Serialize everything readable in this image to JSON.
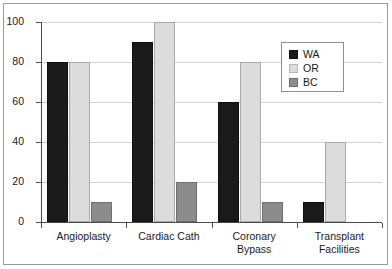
{
  "chart_data": {
    "type": "bar",
    "title": "",
    "subtitle": "",
    "xlabel": "",
    "ylabel": "",
    "categories": [
      "Angioplasty",
      "Cardiac Cath",
      "Coronary\nBypass",
      "Transplant\nFacilities"
    ],
    "series": [
      {
        "name": "WA",
        "values": [
          80,
          90,
          60,
          10
        ],
        "color": "#1a1a1a"
      },
      {
        "name": "OR",
        "values": [
          80,
          100,
          80,
          40
        ],
        "color": "#dcdcdc"
      },
      {
        "name": "BC",
        "values": [
          10,
          20,
          10,
          0
        ],
        "color": "#8c8c8c"
      }
    ],
    "ylim": [
      0,
      100
    ],
    "yticks": [
      0,
      20,
      40,
      60,
      80,
      100
    ],
    "ytick_labels": [
      "0",
      "20",
      "40",
      "60",
      "80",
      "100"
    ],
    "grid": true,
    "grid_axis": "y",
    "legend_position": "upper right inside",
    "annotations": []
  },
  "frame": {
    "border_color": "#9a9a9a",
    "background": "#ffffff"
  }
}
